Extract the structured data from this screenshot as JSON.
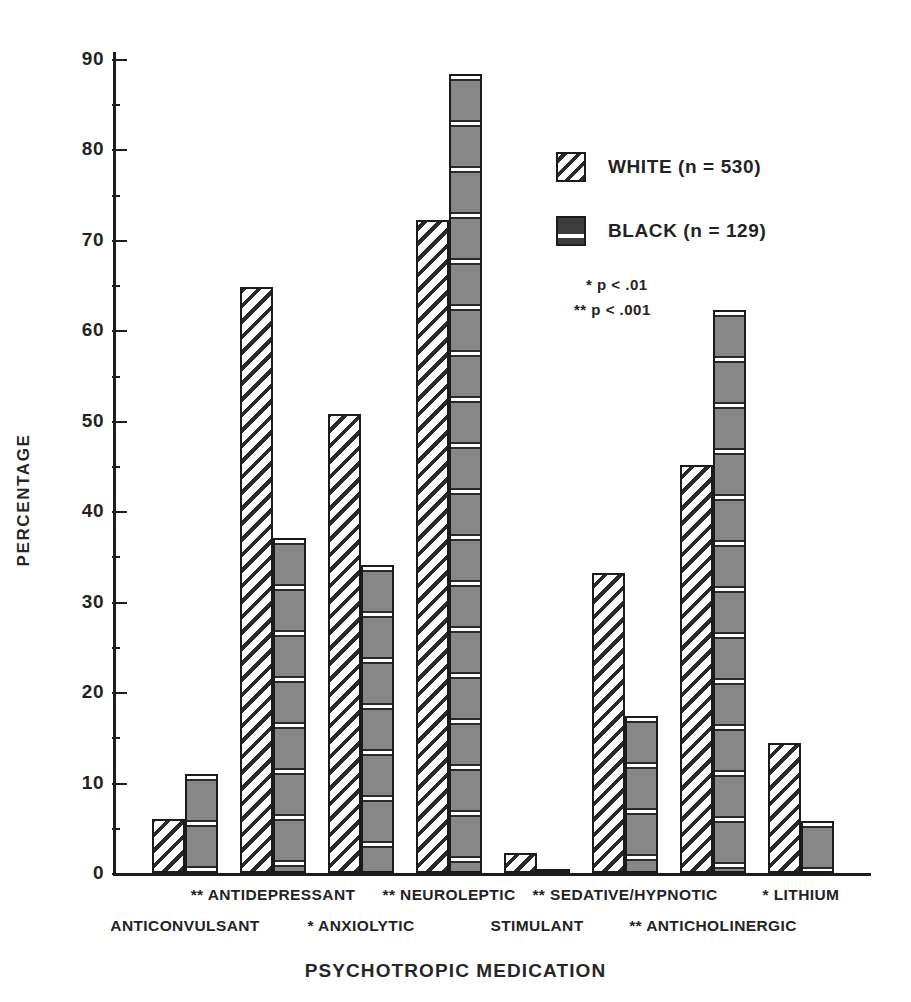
{
  "chart_data": {
    "type": "bar",
    "title": "",
    "xlabel": "PSYCHOTROPIC MEDICATION",
    "ylabel": "PERCENTAGE",
    "ylim": [
      0,
      90
    ],
    "yticks": [
      0,
      10,
      20,
      30,
      40,
      50,
      60,
      70,
      80,
      90
    ],
    "ytick_labels": [
      "0",
      "10",
      "20",
      "30",
      "40",
      "50",
      "60",
      "70",
      "80",
      "90"
    ],
    "minor_ticks": [
      5,
      15,
      25,
      35,
      45,
      55,
      65,
      75,
      85
    ],
    "grid": false,
    "legend_position": "upper right",
    "categories": [
      "ANTICONVULSANT",
      "ANTIDEPRESSANT",
      "ANXIOLYTIC",
      "NEUROLEPTIC",
      "STIMULANT",
      "SEDATIVE/HYPNOTIC",
      "ANTICHOLINERGIC",
      "LITHIUM"
    ],
    "category_significance": [
      "",
      "**",
      "*",
      "**",
      "",
      "**",
      "**",
      "*"
    ],
    "series": [
      {
        "name": "WHITE (n = 530)",
        "pattern": "diagonal-hatch",
        "values": [
          6.0,
          64.8,
          50.8,
          72.2,
          2.2,
          33.2,
          45.1,
          14.4
        ]
      },
      {
        "name": "BLACK (n = 129)",
        "pattern": "horizontal-hatch",
        "values": [
          11.0,
          37.0,
          34.1,
          88.3,
          0.3,
          17.4,
          62.2,
          5.8
        ]
      }
    ],
    "annotations": [
      "* p < .01",
      "** p < .001"
    ]
  },
  "axes": {
    "ylabel": "PERCENTAGE",
    "xlabel": "PSYCHOTROPIC MEDICATION"
  },
  "legend": {
    "entries": [
      {
        "label": "WHITE (n = 530)",
        "swatch": "diagonal-hatch-swatch"
      },
      {
        "label": "BLACK (n = 129)",
        "swatch": "horizontal-hatch-swatch"
      }
    ],
    "notes": [
      {
        "text": "* p < .01"
      },
      {
        "text": "** p < .001"
      }
    ]
  },
  "xlabels": [
    {
      "text": "ANTICONVULSANT",
      "row": "lower"
    },
    {
      "text": "** ANTIDEPRESSANT",
      "row": "upper"
    },
    {
      "text": "* ANXIOLYTIC",
      "row": "lower"
    },
    {
      "text": "** NEUROLEPTIC",
      "row": "upper"
    },
    {
      "text": "STIMULANT",
      "row": "lower"
    },
    {
      "text": "** SEDATIVE/HYPNOTIC",
      "row": "upper"
    },
    {
      "text": "** ANTICHOLINERGIC",
      "row": "lower"
    },
    {
      "text": "* LITHIUM",
      "row": "upper"
    }
  ],
  "colors": {
    "ink": "#1d1d1d",
    "bar_white_fill": "#ffffff",
    "bar_black_fill": "#878787",
    "background": "#ffffff"
  }
}
